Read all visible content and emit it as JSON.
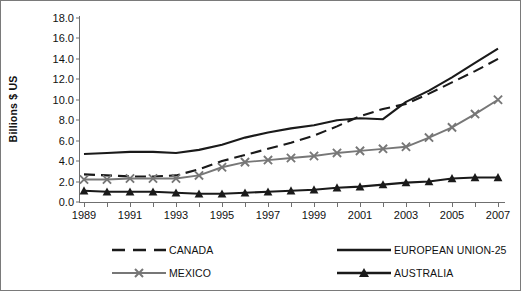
{
  "axes": {
    "ylabel": "Billions $ US",
    "yticks": [
      "0.0",
      "2.0",
      "4.0",
      "6.0",
      "8.0",
      "10.0",
      "12.0",
      "14.0",
      "16.0",
      "18.0"
    ],
    "xticks": [
      "1989",
      "1991",
      "1993",
      "1995",
      "1997",
      "1999",
      "2001",
      "2003",
      "2005",
      "2007"
    ]
  },
  "legend": {
    "items": [
      {
        "label": "CANADA",
        "key": "dashed-line-key",
        "color": "#1a1a1a"
      },
      {
        "label": "EUROPEAN UNION-25",
        "key": "solid-line-key",
        "color": "#1a1a1a"
      },
      {
        "label": "MEXICO",
        "key": "cross-marker-key",
        "color": "#777777"
      },
      {
        "label": "AUSTRALIA",
        "key": "triangle-marker-key",
        "color": "#1a1a1a"
      }
    ]
  },
  "chart_data": {
    "type": "line",
    "title": "",
    "xlabel": "",
    "ylabel": "Billions $ US",
    "xlim": [
      1989,
      2007
    ],
    "ylim": [
      0.0,
      18.0
    ],
    "ytick_step": 2.0,
    "grid": false,
    "legend_position": "bottom",
    "x": [
      1989,
      1990,
      1991,
      1992,
      1993,
      1994,
      1995,
      1996,
      1997,
      1998,
      1999,
      2000,
      2001,
      2002,
      2003,
      2004,
      2005,
      2006,
      2007
    ],
    "series": [
      {
        "name": "CANADA",
        "style": "dashed",
        "color": "#1a1a1a",
        "values": [
          2.7,
          2.6,
          2.5,
          2.5,
          2.6,
          3.2,
          4.0,
          4.6,
          5.2,
          5.8,
          6.5,
          7.4,
          8.4,
          9.1,
          9.6,
          10.6,
          11.7,
          12.8,
          14.0
        ]
      },
      {
        "name": "EUROPEAN UNION-25",
        "style": "solid",
        "color": "#1a1a1a",
        "values": [
          4.7,
          4.8,
          4.9,
          4.9,
          4.8,
          5.1,
          5.6,
          6.3,
          6.8,
          7.2,
          7.5,
          8.0,
          8.2,
          8.1,
          9.8,
          10.9,
          12.2,
          13.6,
          15.0
        ]
      },
      {
        "name": "MEXICO",
        "style": "solid-cross",
        "color": "#777777",
        "values": [
          2.2,
          2.2,
          2.3,
          2.3,
          2.3,
          2.6,
          3.4,
          3.9,
          4.1,
          4.3,
          4.5,
          4.8,
          5.0,
          5.2,
          5.4,
          6.3,
          7.3,
          8.6,
          10.0
        ]
      },
      {
        "name": "AUSTRALIA",
        "style": "solid-triangle",
        "color": "#1a1a1a",
        "values": [
          1.1,
          1.0,
          1.0,
          1.0,
          0.9,
          0.8,
          0.8,
          0.9,
          1.0,
          1.1,
          1.2,
          1.4,
          1.5,
          1.7,
          1.9,
          2.0,
          2.3,
          2.4,
          2.4
        ]
      }
    ]
  }
}
